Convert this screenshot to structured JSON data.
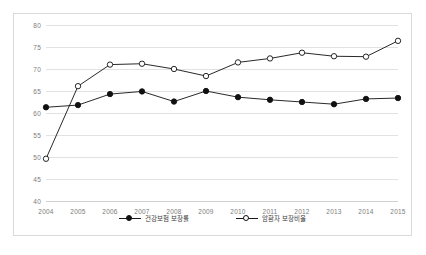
{
  "chart_data": {
    "type": "line",
    "title": "",
    "subtitle": "",
    "xlabel": "",
    "ylabel": "",
    "categories": [
      "2004",
      "2005",
      "2006",
      "2007",
      "2008",
      "2009",
      "2010",
      "2011",
      "2012",
      "2013",
      "2014",
      "2015"
    ],
    "ylim": [
      40,
      80
    ],
    "yticks": [
      40,
      45,
      50,
      55,
      60,
      65,
      70,
      75,
      80
    ],
    "ytick_labels": [
      "40",
      "45",
      "50",
      "55",
      "60",
      "65",
      "70",
      "75",
      "80"
    ],
    "grid": "horizontal",
    "legend_position": "bottom-center",
    "series": [
      {
        "name": "건강보험 보장률",
        "marker": "filled-circle",
        "color": "#111111",
        "values": [
          61.3,
          61.8,
          64.3,
          64.9,
          62.6,
          65.0,
          63.6,
          63.0,
          62.5,
          62.0,
          63.2,
          63.4
        ]
      },
      {
        "name": "암환자 보장비율",
        "marker": "open-circle",
        "color": "#111111",
        "values": [
          49.6,
          66.1,
          71.0,
          71.2,
          70.0,
          68.4,
          71.5,
          72.4,
          73.7,
          72.9,
          72.8,
          76.4
        ]
      }
    ]
  },
  "legend": {
    "items": [
      {
        "label": "건강보험 보장률",
        "marker": "filled-circle"
      },
      {
        "label": "암환자 보장비율",
        "marker": "open-circle"
      }
    ]
  },
  "colors": {
    "frame_border": "#d9d9d9",
    "gridline": "#e2e2e2",
    "series_line": "#1a1a1a",
    "tick_text": "#7c7c7c",
    "legend_text": "#3a3a3a",
    "background": "#ffffff"
  }
}
